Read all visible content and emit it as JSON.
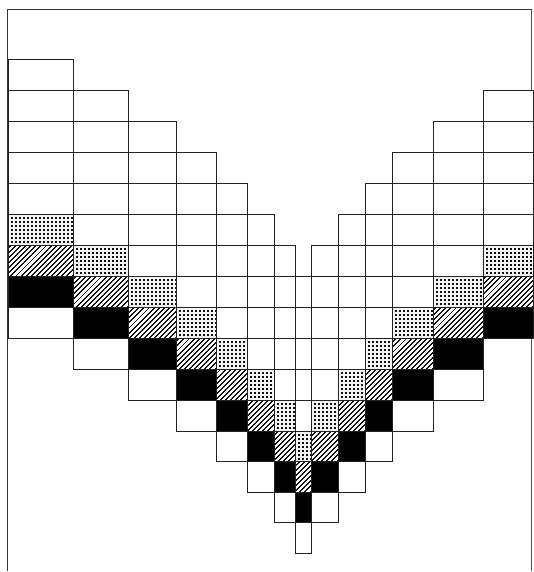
{
  "figure": {
    "legend_patterns": {
      "white": "#ffffff",
      "dotted": "stipple",
      "hatched": "diagonal hatch",
      "black": "#000000"
    },
    "row_tops": [
      59,
      90,
      121,
      152,
      183,
      214,
      245,
      276,
      307,
      338,
      369,
      400,
      431,
      461,
      492,
      522,
      553
    ],
    "columns": [
      {
        "x0": 8,
        "x1": 73,
        "top_row": 0,
        "cells": [
          "white",
          "white",
          "white",
          "white",
          "white",
          "dotted",
          "hatched",
          "black",
          "white"
        ]
      },
      {
        "x0": 73,
        "x1": 128,
        "top_row": 1,
        "cells": [
          "white",
          "white",
          "white",
          "white",
          "white",
          "dotted",
          "hatched",
          "black",
          "white"
        ]
      },
      {
        "x0": 128,
        "x1": 176,
        "top_row": 2,
        "cells": [
          "white",
          "white",
          "white",
          "white",
          "white",
          "dotted",
          "hatched",
          "black",
          "white"
        ]
      },
      {
        "x0": 176,
        "x1": 216,
        "top_row": 3,
        "cells": [
          "white",
          "white",
          "white",
          "white",
          "white",
          "dotted",
          "hatched",
          "black",
          "white"
        ]
      },
      {
        "x0": 216,
        "x1": 247,
        "top_row": 4,
        "cells": [
          "white",
          "white",
          "white",
          "white",
          "white",
          "dotted",
          "hatched",
          "black",
          "white"
        ]
      },
      {
        "x0": 247,
        "x1": 274,
        "top_row": 5,
        "cells": [
          "white",
          "white",
          "white",
          "white",
          "white",
          "dotted",
          "hatched",
          "black",
          "white"
        ]
      },
      {
        "x0": 274,
        "x1": 295,
        "top_row": 6,
        "cells": [
          "white",
          "white",
          "white",
          "white",
          "white",
          "dotted",
          "hatched",
          "black",
          "white"
        ]
      },
      {
        "x0": 295,
        "x1": 311,
        "top_row": 6,
        "open_top": true,
        "cells": [
          "white",
          "white",
          "white",
          "white",
          "white",
          "white",
          "dotted",
          "hatched",
          "black",
          "white"
        ]
      },
      {
        "x0": 311,
        "x1": 338,
        "top_row": 6,
        "cells": [
          "white",
          "white",
          "white",
          "white",
          "white",
          "dotted",
          "hatched",
          "black",
          "white"
        ]
      },
      {
        "x0": 338,
        "x1": 365,
        "top_row": 5,
        "cells": [
          "white",
          "white",
          "white",
          "white",
          "white",
          "dotted",
          "hatched",
          "black",
          "white"
        ]
      },
      {
        "x0": 365,
        "x1": 392,
        "top_row": 4,
        "cells": [
          "white",
          "white",
          "white",
          "white",
          "white",
          "dotted",
          "hatched",
          "black",
          "white"
        ]
      },
      {
        "x0": 392,
        "x1": 433,
        "top_row": 3,
        "cells": [
          "white",
          "white",
          "white",
          "white",
          "white",
          "dotted",
          "hatched",
          "black",
          "white"
        ]
      },
      {
        "x0": 433,
        "x1": 483,
        "top_row": 2,
        "cells": [
          "white",
          "white",
          "white",
          "white",
          "white",
          "dotted",
          "hatched",
          "black",
          "white"
        ]
      },
      {
        "x0": 483,
        "x1": 533,
        "top_row": 1,
        "cells": [
          "white",
          "white",
          "white",
          "white",
          "white",
          "dotted",
          "hatched",
          "black"
        ]
      }
    ]
  }
}
